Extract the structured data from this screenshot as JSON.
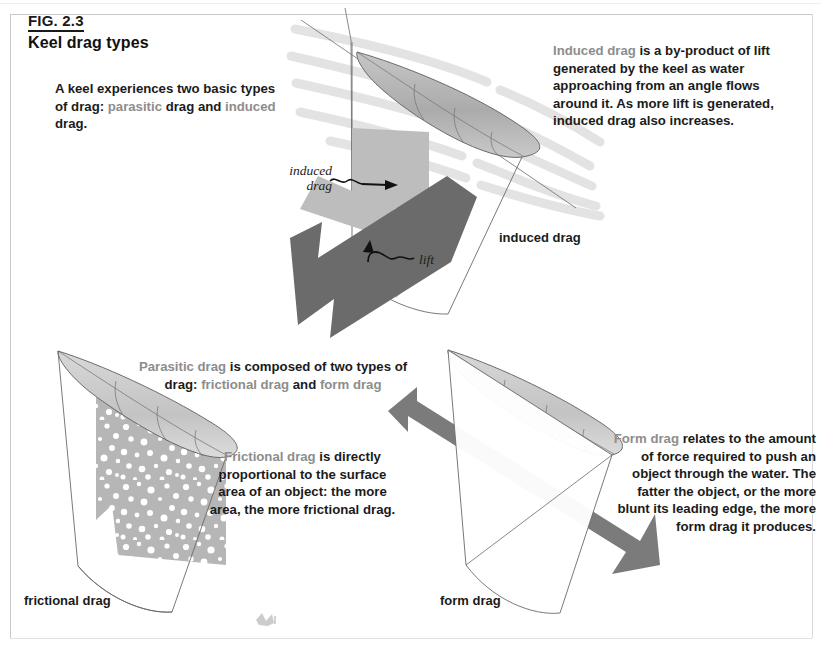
{
  "figure": {
    "number": "FIG. 2.3",
    "title": "Keel drag types"
  },
  "paragraphs": {
    "intro": {
      "lead_gray": "",
      "full": "A keel experiences two basic types of drag: parasitic drag and induced drag.",
      "segments": [
        {
          "text": "A keel experiences two basic types of drag: ",
          "color": "black"
        },
        {
          "text": "parasitic",
          "color": "gray"
        },
        {
          "text": " drag and ",
          "color": "black"
        },
        {
          "text": "induced",
          "color": "gray"
        },
        {
          "text": " drag.",
          "color": "black"
        }
      ]
    },
    "induced": {
      "full": "Induced drag is a by-product of lift generated by the keel as water approaching from an angle flows around it. As more lift is generated, induced drag also increases.",
      "segments": [
        {
          "text": "Induced drag",
          "color": "gray"
        },
        {
          "text": " is a by-product of lift generated by the keel as water approaching from an angle flows around it. As more lift is generated, induced drag also increases.",
          "color": "black"
        }
      ]
    },
    "parasitic": {
      "full": "Parasitic drag is composed of two types of drag: frictional drag and form drag",
      "segments": [
        {
          "text": "Parasitic drag",
          "color": "gray"
        },
        {
          "text": " is composed of two types of drag: ",
          "color": "black"
        },
        {
          "text": "frictional drag",
          "color": "gray"
        },
        {
          "text": " and ",
          "color": "black"
        },
        {
          "text": "form drag",
          "color": "gray"
        }
      ]
    },
    "frictional": {
      "full": "Frictional drag is directly proportional to the surface area of an object: the more area, the more frictional drag.",
      "segments": [
        {
          "text": "Frictional drag",
          "color": "gray"
        },
        {
          "text": " is directly proportional to the surface area of an object: the more area, the more frictional drag.",
          "color": "black"
        }
      ]
    },
    "form": {
      "full": "Form drag relates to the amount of force required to push an object through the water. The fatter the object, or the more blunt its leading edge, the more form drag it produces.",
      "segments": [
        {
          "text": "Form drag",
          "color": "gray"
        },
        {
          "text": " relates to the amount of force required to push an object through the water. The fatter the object, or the more blunt its leading edge, the more form drag it produces.",
          "color": "black"
        }
      ]
    }
  },
  "labels": {
    "induced_drag_diagram": "induced drag",
    "frictional_drag_diagram": "frictional drag",
    "form_drag_diagram": "form drag",
    "arrow_induced_drag": "induced\ndrag",
    "arrow_induced_drag_line1": "induced",
    "arrow_induced_drag_line2": "drag",
    "arrow_lift": "lift"
  },
  "colors": {
    "text_black": "#1b1b1b",
    "text_gray": "#8d8d8d",
    "arrow_dark": "#6b6b6b",
    "arrow_light": "#b9b9b9",
    "keel_fill_gray": "#b3b3b3",
    "outline": "#4a4a4a",
    "water_flow": "#e2e2e2",
    "page_background": "#ffffff"
  },
  "diagrams": [
    {
      "name": "induced-drag-keel",
      "caption": "induced drag",
      "elements": [
        "keel-fin-top-view",
        "water-flow-lines",
        "induced-drag-arrow",
        "lift-arrow",
        "keel-outline"
      ]
    },
    {
      "name": "frictional-drag-keel",
      "caption": "frictional drag",
      "elements": [
        "keel-fin-top-view",
        "keel-outline",
        "speckled-surface-texture"
      ]
    },
    {
      "name": "form-drag-keel",
      "caption": "form drag",
      "elements": [
        "keel-fin-top-view",
        "keel-outline",
        "form-drag-arrow"
      ]
    }
  ]
}
